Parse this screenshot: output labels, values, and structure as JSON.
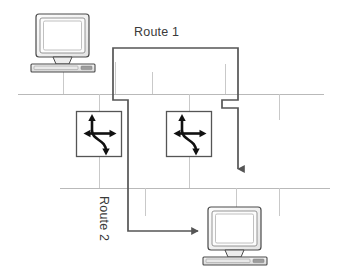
{
  "diagram": {
    "canvas": {
      "width": 340,
      "height": 276,
      "background": "#ffffff"
    },
    "colors": {
      "route": "#555555",
      "backbone": "#b9b9b9",
      "stub": "#c9c9c9",
      "device_outline": "#4a4a4a",
      "device_fill": "#f2f2f2",
      "screen_fill": "#ffffff",
      "router_glyph": "#111111",
      "label_text": "#3a3a3a"
    },
    "labels": {
      "route1": "Route 1",
      "route2": "Route 2"
    },
    "nodes": [
      {
        "id": "pc-top-left",
        "type": "computer",
        "x": 33,
        "y": 13,
        "w": 62,
        "h": 56
      },
      {
        "id": "router-left",
        "type": "router",
        "x": 76,
        "y": 111,
        "w": 46,
        "h": 46
      },
      {
        "id": "router-right",
        "type": "router",
        "x": 166,
        "y": 111,
        "w": 46,
        "h": 46
      },
      {
        "id": "pc-bottom-right",
        "type": "computer",
        "x": 205,
        "y": 206,
        "w": 62,
        "h": 56
      }
    ],
    "backbones": [
      {
        "id": "backbone-upper",
        "y": 94,
        "x1": 18,
        "x2": 324
      },
      {
        "id": "backbone-lower",
        "y": 188,
        "x1": 60,
        "x2": 330
      }
    ],
    "stubs": [
      {
        "id": "stub-a",
        "x": 63,
        "y1": 69,
        "y2": 94
      },
      {
        "id": "stub-b",
        "x": 115,
        "y1": 69,
        "y2": 94
      },
      {
        "id": "stub-c",
        "x": 152,
        "y1": 72,
        "y2": 94
      },
      {
        "id": "stub-d",
        "x": 225,
        "y1": 66,
        "y2": 94
      },
      {
        "id": "stub-e",
        "x": 99,
        "y1": 94,
        "y2": 111
      },
      {
        "id": "stub-f",
        "x": 189,
        "y1": 94,
        "y2": 111
      },
      {
        "id": "stub-g",
        "x": 279,
        "y1": 94,
        "y2": 118
      },
      {
        "id": "stub-h",
        "x": 99,
        "y1": 157,
        "y2": 188
      },
      {
        "id": "stub-i",
        "x": 189,
        "y1": 157,
        "y2": 188
      },
      {
        "id": "stub-j",
        "x": 145,
        "y1": 188,
        "y2": 214
      },
      {
        "id": "stub-k",
        "x": 236,
        "y1": 206,
        "y2": 188
      },
      {
        "id": "stub-l",
        "x": 279,
        "y1": 188,
        "y2": 214
      }
    ],
    "routes": [
      {
        "id": "route-1",
        "label": "Route 1",
        "stroke": "#555555",
        "width": 1.8,
        "arrow": "down",
        "points": "113,52 113,48 238,48 238,100 222,100 222,108 238,108 238,169"
      },
      {
        "id": "route-2",
        "label": "Route 2",
        "stroke": "#555555",
        "width": 1.8,
        "arrow": "right",
        "points": "113,52 113,100 128,100 128,108 128,231 200,231"
      }
    ]
  }
}
